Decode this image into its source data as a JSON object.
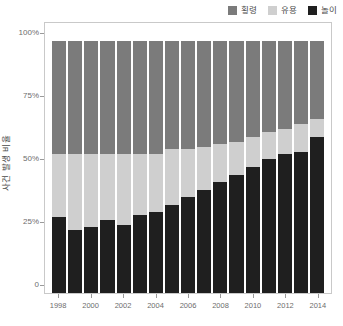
{
  "chart_data": {
    "type": "bar",
    "subtype": "stacked-100-percent",
    "title": "",
    "xlabel": "",
    "ylabel": "사건 발생 비율",
    "ylim": [
      0,
      100
    ],
    "ytick_labels": [
      "100%",
      "75%",
      "50%",
      "25%",
      "0"
    ],
    "ytick_values": [
      100,
      75,
      50,
      25,
      0
    ],
    "grid": false,
    "legend_position": "top-right",
    "categories": [
      "1998",
      "1999",
      "2000",
      "2001",
      "2002",
      "2003",
      "2004",
      "2005",
      "2006",
      "2007",
      "2008",
      "2009",
      "2010",
      "2011",
      "2012",
      "2013",
      "2014"
    ],
    "xtick_labels": [
      "1998",
      "2000",
      "2002",
      "2004",
      "2006",
      "2008",
      "2010",
      "2012",
      "2014"
    ],
    "series": [
      {
        "name": "놀이",
        "color": "#1f1f1f",
        "stack_order": 0,
        "values": [
          30,
          25,
          26,
          29,
          27,
          31,
          32,
          35,
          38,
          41,
          44,
          47,
          50,
          53,
          55,
          56,
          62
        ]
      },
      {
        "name": "유용",
        "color": "#cfcfcf",
        "stack_order": 1,
        "values": [
          25,
          30,
          29,
          26,
          28,
          24,
          23,
          22,
          19,
          17,
          15,
          13,
          12,
          11,
          10,
          11,
          7
        ]
      },
      {
        "name": "횡령",
        "color": "#7b7b7b",
        "stack_order": 2,
        "values": [
          45,
          45,
          45,
          45,
          45,
          45,
          45,
          43,
          43,
          42,
          41,
          40,
          38,
          36,
          35,
          33,
          31
        ]
      }
    ]
  },
  "legend": {
    "items": [
      {
        "label": "횡령",
        "color": "#7b7b7b"
      },
      {
        "label": "유용",
        "color": "#cfcfcf"
      },
      {
        "label": "놀이",
        "color": "#1f1f1f"
      }
    ]
  },
  "axes": {
    "y_title": "사건 발생 비율"
  }
}
